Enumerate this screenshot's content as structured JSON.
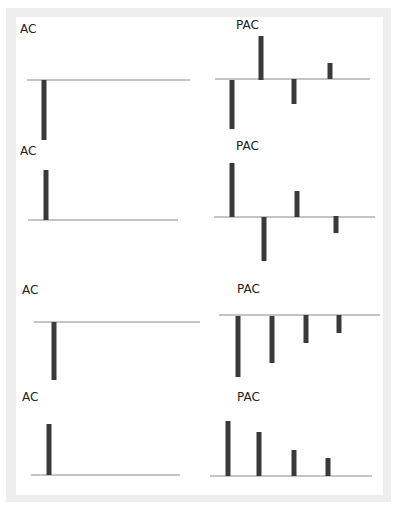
{
  "chart_data": [
    {
      "type": "bar",
      "panel": "row1-left",
      "title": "AC",
      "lags": [
        1
      ],
      "values": [
        -1.0
      ],
      "axis": {
        "y": 80,
        "x1": 27,
        "x2": 190
      },
      "bars_px": [
        {
          "x": 44,
          "y_top": 80,
          "y_bottom": 140
        }
      ]
    },
    {
      "type": "bar",
      "panel": "row1-right",
      "title": "PAC",
      "lags": [
        1,
        2,
        3,
        4
      ],
      "values": [
        -0.82,
        0.73,
        -0.42,
        0.27
      ],
      "axis": {
        "y": 79,
        "x1": 215,
        "x2": 370
      },
      "bars_px": [
        {
          "x": 232,
          "y_top": 80,
          "y_bottom": 129
        },
        {
          "x": 261,
          "y_top": 36,
          "y_bottom": 80
        },
        {
          "x": 294,
          "y_top": 79,
          "y_bottom": 104
        },
        {
          "x": 330,
          "y_top": 63,
          "y_bottom": 79
        }
      ]
    },
    {
      "type": "bar",
      "panel": "row2-left",
      "title": "AC",
      "lags": [
        1
      ],
      "values": [
        0.85
      ],
      "axis": {
        "y": 220,
        "x1": 28,
        "x2": 178
      },
      "bars_px": [
        {
          "x": 46,
          "y_top": 170,
          "y_bottom": 220
        }
      ]
    },
    {
      "type": "bar",
      "panel": "row2-right",
      "title": "PAC",
      "lags": [
        1,
        2,
        3,
        4
      ],
      "values": [
        0.9,
        -0.73,
        0.43,
        -0.28
      ],
      "axis": {
        "y": 217,
        "x1": 214,
        "x2": 375
      },
      "bars_px": [
        {
          "x": 232,
          "y_top": 163,
          "y_bottom": 217
        },
        {
          "x": 264,
          "y_top": 217,
          "y_bottom": 261
        },
        {
          "x": 297,
          "y_top": 191,
          "y_bottom": 217
        },
        {
          "x": 336,
          "y_top": 216,
          "y_bottom": 233
        }
      ]
    },
    {
      "type": "bar",
      "panel": "row3-left",
      "title": "AC",
      "lags": [
        1
      ],
      "values": [
        -0.97
      ],
      "axis": {
        "y": 322,
        "x1": 34,
        "x2": 200
      },
      "bars_px": [
        {
          "x": 54,
          "y_top": 322,
          "y_bottom": 380
        }
      ]
    },
    {
      "type": "bar",
      "panel": "row3-right",
      "title": "PAC",
      "lags": [
        1,
        2,
        3,
        4
      ],
      "values": [
        -1.0,
        -0.77,
        -0.46,
        -0.3
      ],
      "axis": {
        "y": 315,
        "x1": 219,
        "x2": 380
      },
      "bars_px": [
        {
          "x": 238,
          "y_top": 316,
          "y_bottom": 377
        },
        {
          "x": 272,
          "y_top": 316,
          "y_bottom": 363
        },
        {
          "x": 306,
          "y_top": 315,
          "y_bottom": 343
        },
        {
          "x": 339,
          "y_top": 315,
          "y_bottom": 333
        }
      ]
    },
    {
      "type": "bar",
      "panel": "row4-left",
      "title": "AC",
      "lags": [
        1
      ],
      "values": [
        0.85
      ],
      "axis": {
        "y": 475,
        "x1": 31,
        "x2": 180
      },
      "bars_px": [
        {
          "x": 49,
          "y_top": 424,
          "y_bottom": 475
        }
      ]
    },
    {
      "type": "bar",
      "panel": "row4-right",
      "title": "PAC",
      "lags": [
        1,
        2,
        3,
        4
      ],
      "values": [
        0.92,
        0.73,
        0.43,
        0.3
      ],
      "axis": {
        "y": 476,
        "x1": 210,
        "x2": 372
      },
      "bars_px": [
        {
          "x": 228,
          "y_top": 421,
          "y_bottom": 476
        },
        {
          "x": 259,
          "y_top": 432,
          "y_bottom": 476
        },
        {
          "x": 294,
          "y_top": 450,
          "y_bottom": 476
        },
        {
          "x": 328,
          "y_top": 458,
          "y_bottom": 476
        }
      ]
    }
  ],
  "labels": [
    {
      "text": "AC",
      "x": 20,
      "y": 33
    },
    {
      "text": "PAC",
      "x": 236,
      "y": 29
    },
    {
      "text": "AC",
      "x": 20,
      "y": 155
    },
    {
      "text": "PAC",
      "x": 236,
      "y": 150
    },
    {
      "text": "AC",
      "x": 22,
      "y": 294
    },
    {
      "text": "PAC",
      "x": 237,
      "y": 293
    },
    {
      "text": "AC",
      "x": 22,
      "y": 401
    },
    {
      "text": "PAC",
      "x": 237,
      "y": 401
    }
  ],
  "colors": {
    "bar": "#3a3a3a",
    "axis": "#8a8a8a",
    "frame": "#eeeeee",
    "background": "#ffffff"
  }
}
